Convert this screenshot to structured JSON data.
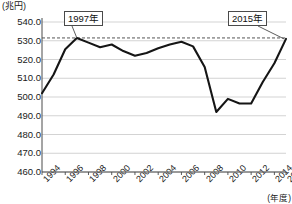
{
  "chart_data": {
    "type": "line",
    "title": "",
    "unit_label_y": "(兆円)",
    "unit_label_x": "(年度)",
    "xlabel": "年度",
    "ylabel": "兆円",
    "ylim": [
      460.0,
      540.0
    ],
    "ytick_step": 10.0,
    "grid": true,
    "legend": "none",
    "x": [
      1994,
      1995,
      1996,
      1997,
      1998,
      1999,
      2000,
      2001,
      2002,
      2003,
      2004,
      2005,
      2006,
      2007,
      2008,
      2009,
      2010,
      2011,
      2012,
      2013,
      2014,
      2015
    ],
    "values": [
      502.0,
      512.0,
      525.5,
      531.5,
      529.0,
      526.5,
      528.0,
      524.5,
      522.0,
      523.5,
      526.0,
      528.0,
      529.5,
      527.0,
      516.0,
      492.0,
      499.0,
      496.5,
      496.5,
      508.0,
      518.0,
      531.0
    ],
    "ytick_labels": [
      "540.0",
      "530.0",
      "520.0",
      "510.0",
      "500.0",
      "490.0",
      "480.0",
      "470.0",
      "460.0"
    ],
    "ytick_values": [
      540.0,
      530.0,
      520.0,
      510.0,
      500.0,
      490.0,
      480.0,
      470.0,
      460.0
    ],
    "xtick_labels": [
      "1994",
      "1996",
      "1998",
      "2000",
      "2002",
      "2004",
      "2006",
      "2008",
      "2010",
      "2012",
      "2014",
      "2015"
    ],
    "xtick_values": [
      1994,
      1996,
      1998,
      2000,
      2002,
      2004,
      2006,
      2008,
      2010,
      2012,
      2014,
      2015
    ],
    "reference_line": {
      "value": 531.5,
      "style": "dashed",
      "label": "1997年 peak level"
    },
    "annotations": [
      {
        "name": "peak-1997",
        "label": "1997年",
        "x": 1997,
        "y": 531.5
      },
      {
        "name": "peak-2015",
        "label": "2015年",
        "x": 2015,
        "y": 531.0
      }
    ],
    "colors": {
      "line": "#151515",
      "grid": "#c8c8c8",
      "axis": "#4a4a4a",
      "reference": "#555555",
      "background": "#ffffff"
    }
  },
  "callouts": {
    "left": "1997年",
    "right": "2015年"
  },
  "axis": {
    "unit_y": "(兆円)",
    "unit_x": "(年度)"
  }
}
